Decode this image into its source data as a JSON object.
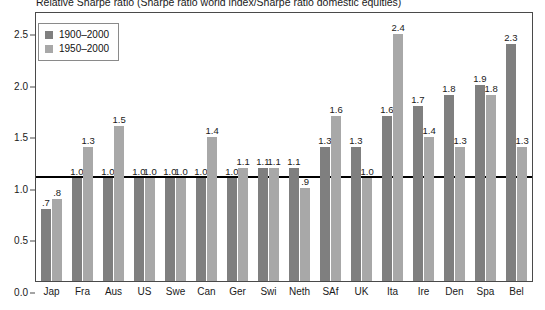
{
  "chart_data": {
    "type": "bar",
    "title": "Relative Sharpe ratio (Sharpe ratio world index/Sharpe ratio domestic equities)",
    "xlabel": "",
    "ylabel": "",
    "ylim": [
      0.0,
      2.6
    ],
    "yticks": [
      "0.0",
      "0.5",
      "1.0",
      "1.5",
      "2.0",
      "2.5"
    ],
    "ytick_values": [
      0.0,
      0.5,
      1.0,
      1.5,
      2.0,
      2.5
    ],
    "grid": false,
    "reference_line": 1.0,
    "legend_position": "top-left",
    "categories": [
      "Jap",
      "Fra",
      "Aus",
      "US",
      "Swe",
      "Can",
      "Ger",
      "Swi",
      "Neth",
      "SAf",
      "UK",
      "Ita",
      "Ire",
      "Den",
      "Spa",
      "Bel"
    ],
    "series": [
      {
        "name": "1900–2000",
        "color": "#7f7f7f",
        "values": [
          0.7,
          1.0,
          1.0,
          1.0,
          1.0,
          1.0,
          1.0,
          1.1,
          1.1,
          1.3,
          1.3,
          1.6,
          1.7,
          1.8,
          1.9,
          2.3
        ],
        "labels": [
          ".7",
          "1.0",
          "1.0",
          "1.0",
          "1.0",
          "1.0",
          "1.0",
          "1.1",
          "1.1",
          "1.3",
          "1.3",
          "1.6",
          "1.7",
          "1.8",
          "1.9",
          "2.3"
        ]
      },
      {
        "name": "1950–2000",
        "color": "#a8a8a8",
        "values": [
          0.8,
          1.3,
          1.5,
          1.0,
          1.0,
          1.4,
          1.1,
          1.1,
          0.9,
          1.6,
          1.0,
          2.4,
          1.4,
          1.3,
          1.8,
          1.3
        ],
        "labels": [
          ".8",
          "1.3",
          "1.5",
          "1.0",
          "1.0",
          "1.4",
          "1.1",
          "1.1",
          ".9",
          "1.6",
          "1.0",
          "2.4",
          "1.4",
          "1.3",
          "1.8",
          "1.3"
        ]
      }
    ]
  },
  "legend": {
    "items": [
      {
        "label": "1900–2000",
        "swatch": "s0"
      },
      {
        "label": "1950–2000",
        "swatch": "s1"
      }
    ]
  }
}
